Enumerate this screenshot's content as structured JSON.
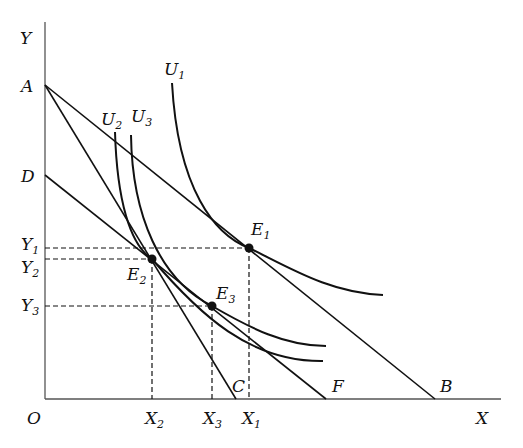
{
  "diagram": {
    "type": "consumer-choice-income-substitution-effect",
    "axes": {
      "x_label": "X",
      "y_label": "Y",
      "origin_label": "O"
    },
    "intercept_labels": {
      "a": "A",
      "d": "D",
      "c": "C",
      "f": "F",
      "b": "B"
    },
    "curves": [
      {
        "name": "U",
        "sub": "1"
      },
      {
        "name": "U",
        "sub": "2"
      },
      {
        "name": "U",
        "sub": "3"
      }
    ],
    "points": [
      {
        "name": "E",
        "sub": "1"
      },
      {
        "name": "E",
        "sub": "2"
      },
      {
        "name": "E",
        "sub": "3"
      }
    ],
    "y_ticks": [
      {
        "name": "Y",
        "sub": "1"
      },
      {
        "name": "Y",
        "sub": "2"
      },
      {
        "name": "Y",
        "sub": "3"
      }
    ],
    "x_ticks": [
      {
        "name": "X",
        "sub": "2"
      },
      {
        "name": "X",
        "sub": "3"
      },
      {
        "name": "X",
        "sub": "1"
      }
    ],
    "budget_lines": [
      "AB",
      "AC",
      "DF"
    ]
  }
}
